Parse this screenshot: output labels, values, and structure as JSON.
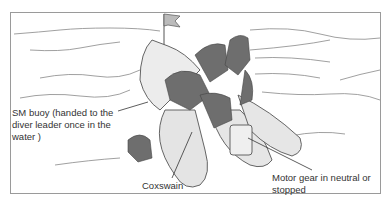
{
  "figure": {
    "labels": [
      {
        "id": "buoy",
        "lines": [
          "SM buoy (handed to the",
          "diver leader once in the",
          "water )"
        ]
      },
      {
        "id": "coxswain",
        "lines": [
          "Coxswain"
        ]
      },
      {
        "id": "motor",
        "lines": [
          "Motor gear in neutral or",
          "stopped"
        ]
      }
    ]
  },
  "colors": {
    "line": "#555555",
    "boat_fill": "#e6e6e6",
    "dark_fill": "#6e6e6e",
    "frame": "#9a9a9a"
  }
}
